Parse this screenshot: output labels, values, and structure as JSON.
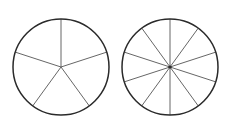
{
  "diagram": {
    "circles": [
      {
        "id": "left",
        "cx": 61,
        "cy": 67,
        "r": 48,
        "sectors": 5,
        "center_dot": false
      },
      {
        "id": "right",
        "cx": 170,
        "cy": 67,
        "r": 48,
        "sectors": 10,
        "center_dot": true
      }
    ],
    "colors": {
      "outline": "#2a2a2a",
      "spoke": "#555555",
      "background": "#ffffff"
    }
  }
}
